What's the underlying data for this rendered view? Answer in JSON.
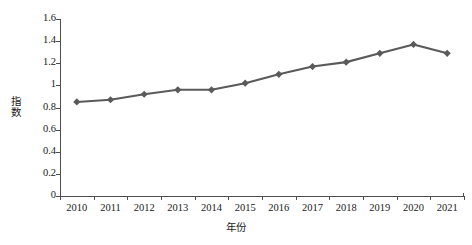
{
  "chart_data": {
    "type": "line",
    "title": "",
    "xlabel": "年份",
    "ylabel": "指数",
    "categories": [
      "2010",
      "2011",
      "2012",
      "2013",
      "2014",
      "2015",
      "2016",
      "2017",
      "2018",
      "2019",
      "2020",
      "2021"
    ],
    "values": [
      0.85,
      0.87,
      0.92,
      0.96,
      0.96,
      1.02,
      1.1,
      1.17,
      1.21,
      1.29,
      1.37,
      1.29
    ],
    "series": [
      {
        "name": "指数",
        "values": [
          0.85,
          0.87,
          0.92,
          0.96,
          0.96,
          1.02,
          1.1,
          1.17,
          1.21,
          1.29,
          1.37,
          1.29
        ],
        "color": "#5a5a5a",
        "marker": "diamond"
      }
    ],
    "ylim": [
      0,
      1.6
    ],
    "ytick_values": [
      0,
      0.2,
      0.4,
      0.6,
      0.8,
      1,
      1.2,
      1.4,
      1.6
    ],
    "ytick_labels": [
      "0",
      "0.2",
      "0.4",
      "0.6",
      "0.8",
      "1",
      "1.2",
      "1.4",
      "1.6"
    ],
    "grid": false,
    "legend": false,
    "legend_position": "none",
    "background_color": "#ffffff",
    "axis_color": "#4d4d4d"
  }
}
